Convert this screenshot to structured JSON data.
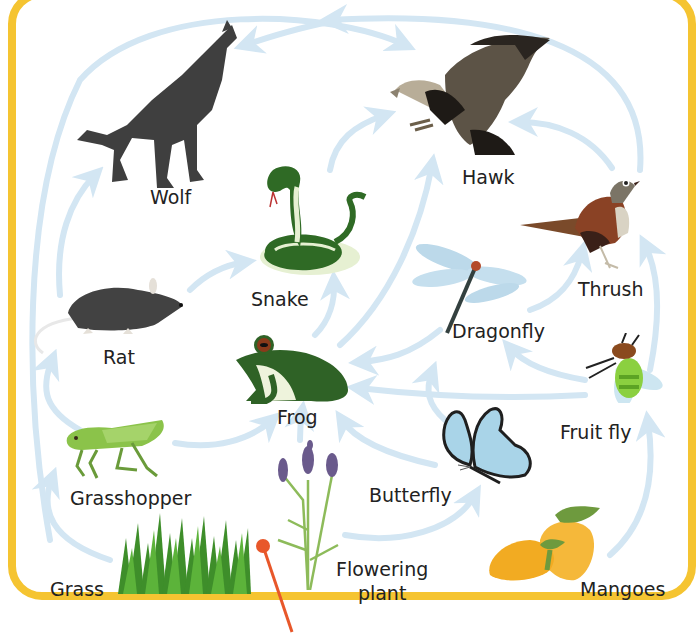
{
  "diagram": {
    "type": "food-web",
    "frame_color": "#f5c431",
    "arrow_color": "#d3e6f3",
    "pin_color": "#e8572a",
    "organisms": [
      {
        "id": "wolf",
        "label": "Wolf",
        "kind": "consumer"
      },
      {
        "id": "hawk",
        "label": "Hawk",
        "kind": "consumer"
      },
      {
        "id": "snake",
        "label": "Snake",
        "kind": "consumer"
      },
      {
        "id": "thrush",
        "label": "Thrush",
        "kind": "consumer"
      },
      {
        "id": "dragonfly",
        "label": "Dragonfly",
        "kind": "consumer"
      },
      {
        "id": "rat",
        "label": "Rat",
        "kind": "consumer"
      },
      {
        "id": "frog",
        "label": "Frog",
        "kind": "consumer"
      },
      {
        "id": "fruit_fly",
        "label": "Fruit fly",
        "kind": "consumer"
      },
      {
        "id": "butterfly",
        "label": "Butterfly",
        "kind": "consumer"
      },
      {
        "id": "grasshopper",
        "label": "Grasshopper",
        "kind": "consumer"
      },
      {
        "id": "grass",
        "label": "Grass",
        "kind": "producer"
      },
      {
        "id": "flowering_plant",
        "label": "Flowering plant",
        "label_line1": "Flowering",
        "label_line2": "plant",
        "kind": "producer"
      },
      {
        "id": "mangoes",
        "label": "Mangoes",
        "kind": "producer"
      }
    ],
    "edges": [
      {
        "from": "grass",
        "to": "grasshopper"
      },
      {
        "from": "grass",
        "to": "rat"
      },
      {
        "from": "grasshopper",
        "to": "rat"
      },
      {
        "from": "grasshopper",
        "to": "frog"
      },
      {
        "from": "rat",
        "to": "wolf"
      },
      {
        "from": "rat",
        "to": "snake"
      },
      {
        "from": "rat",
        "to": "hawk"
      },
      {
        "from": "snake",
        "to": "hawk"
      },
      {
        "from": "frog",
        "to": "snake"
      },
      {
        "from": "frog",
        "to": "hawk"
      },
      {
        "from": "flowering_plant",
        "to": "frog"
      },
      {
        "from": "flowering_plant",
        "to": "butterfly"
      },
      {
        "from": "butterfly",
        "to": "frog"
      },
      {
        "from": "butterfly",
        "to": "dragonfly"
      },
      {
        "from": "dragonfly",
        "to": "frog"
      },
      {
        "from": "dragonfly",
        "to": "thrush"
      },
      {
        "from": "fruit_fly",
        "to": "frog"
      },
      {
        "from": "fruit_fly",
        "to": "dragonfly"
      },
      {
        "from": "fruit_fly",
        "to": "thrush"
      },
      {
        "from": "mangoes",
        "to": "fruit_fly"
      },
      {
        "from": "thrush",
        "to": "hawk"
      },
      {
        "from": "hawk",
        "to": "wolf"
      },
      {
        "from": "thrush",
        "to": "wolf"
      }
    ]
  }
}
